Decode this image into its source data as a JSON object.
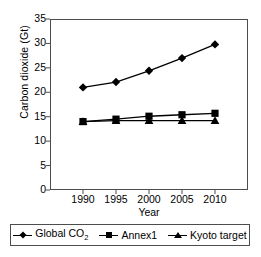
{
  "chart_data": {
    "type": "line",
    "title": "",
    "xlabel": "Year",
    "ylabel": "Carbon dioxide (Gt)",
    "x": [
      1990,
      1995,
      2000,
      2005,
      2010
    ],
    "xticklabels": [
      "1990",
      "1995",
      "2000",
      "2005",
      "2010"
    ],
    "yticklabels": [
      "0",
      "5",
      "10",
      "15",
      "20",
      "25",
      "30",
      "35"
    ],
    "yticks": [
      0,
      5,
      10,
      15,
      20,
      25,
      30,
      35
    ],
    "xlim": [
      1988,
      2012
    ],
    "ylim": [
      0,
      35
    ],
    "grid": false,
    "legend_position": "bottom",
    "series": [
      {
        "name": "Global CO2",
        "label_html": "Global CO<sub>2</sub>",
        "marker": "diamond",
        "color": "#000000",
        "values": [
          21.0,
          22.1,
          24.4,
          27.0,
          29.8
        ]
      },
      {
        "name": "Annex1",
        "label_html": "Annex1",
        "marker": "square",
        "color": "#000000",
        "values": [
          14.0,
          14.5,
          15.1,
          15.4,
          15.7
        ]
      },
      {
        "name": "Kyoto target",
        "label_html": "Kyoto target",
        "marker": "triangle",
        "color": "#000000",
        "values": [
          14.0,
          14.2,
          14.2,
          14.2,
          14.2
        ]
      }
    ]
  },
  "legend": {
    "items": [
      {
        "label": "Global CO2",
        "marker": "diamond"
      },
      {
        "label": "Annex1",
        "marker": "square"
      },
      {
        "label": "Kyoto target",
        "marker": "triangle"
      }
    ]
  },
  "colors": {
    "axis": "#4d4d4d",
    "series": "#000000",
    "background": "#ffffff"
  }
}
